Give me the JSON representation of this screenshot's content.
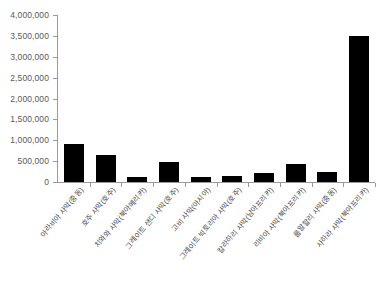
{
  "chart_data": {
    "type": "bar",
    "title": "",
    "xlabel": "",
    "ylabel": "",
    "ylim": [
      0,
      4000000
    ],
    "ytick_values": [
      0,
      500000,
      1000000,
      1500000,
      2000000,
      2500000,
      3000000,
      3500000,
      4000000
    ],
    "ytick_labels": [
      "0",
      "500,000",
      "1,000,000",
      "1,500,000",
      "2,000,000",
      "2,500,000",
      "3,000,000",
      "3,500,000",
      "4,000,000"
    ],
    "grid": false,
    "legend": "none",
    "bar_color": "#000000",
    "axis_color": "#9a9a9a",
    "categories": [
      "아라비아 사막(중동)",
      "호주 사막(호주)",
      "치와와 사막(북아메리카)",
      "그레이트 샌디 사막(호주)",
      "고비 사막(아시아)",
      "그레이트 빅토리아 사막(호주)",
      "칼라하리 사막(남아프리카)",
      "리비아 사막(북아프리카)",
      "룹알할리 사막(중동)",
      "사하라 사막(북아프리카)"
    ],
    "values": [
      900000,
      640000,
      120000,
      480000,
      130000,
      140000,
      220000,
      440000,
      250000,
      3500000
    ]
  }
}
